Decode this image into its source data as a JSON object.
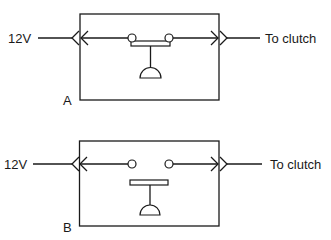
{
  "diagram": {
    "type": "switch-schematic",
    "panels": [
      {
        "id": "A",
        "label": "A",
        "state": "closed",
        "input_label": "12V",
        "output_label": "To clutch"
      },
      {
        "id": "B",
        "label": "B",
        "state": "open",
        "input_label": "12V",
        "output_label": "To clutch"
      }
    ],
    "colors": {
      "line": "#1a1a1a",
      "background": "#ffffff"
    }
  }
}
